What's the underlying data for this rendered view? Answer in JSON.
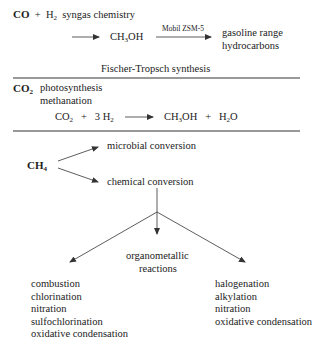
{
  "sections": {
    "co": {
      "reactant": "CO",
      "plus": "+",
      "h2": "H",
      "h2_sub": "2",
      "label": "syngas chemistry",
      "product": "CH",
      "product_sub": "3",
      "product_tail": "OH",
      "catalyst": "Mobil ZSM-5",
      "final_line1": "gasoline range",
      "final_line2": "hydrocarbons",
      "footer": "Fischer-Tropsch synthesis"
    },
    "co2": {
      "reactant": "CO",
      "reactant_sub": "2",
      "process1": "photosynthesis",
      "process2": "methanation",
      "equation": {
        "lhs1": "CO",
        "lhs1_sub": "2",
        "plus1": "+",
        "lhs2": "3 H",
        "lhs2_sub": "2",
        "rhs1": "CH",
        "rhs1_sub": "3",
        "rhs1_tail": "OH",
        "plus2": "+",
        "rhs2": "H",
        "rhs2_sub": "2",
        "rhs2_tail": "O"
      }
    },
    "ch4": {
      "reactant": "CH",
      "reactant_sub": "4",
      "branch_top": "microbial conversion",
      "branch_bottom": "chemical conversion",
      "middle_label_line1": "organometallic",
      "middle_label_line2": "reactions",
      "left_list": [
        "combustion",
        "chlorination",
        "nitration",
        "sulfochlorination",
        "oxidative condensation"
      ],
      "right_list": [
        "halogenation",
        "alkylation",
        "nitration",
        "oxidative condensation"
      ]
    }
  },
  "colors": {
    "text": "#222222",
    "lines": "#333333",
    "background": "#ffffff"
  }
}
